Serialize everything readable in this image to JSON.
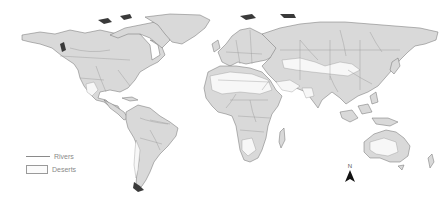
{
  "map": {
    "type": "world-map",
    "projection": "equirectangular",
    "colors": {
      "land": "#d9d9d9",
      "desert": "#f7f7f7",
      "rivers": "#9a9a9a",
      "borders": "#8c8c8c",
      "ocean": "#ffffff"
    }
  },
  "legend": {
    "items": [
      {
        "symbol": "line",
        "label": "Rivers"
      },
      {
        "symbol": "box",
        "label": "Deserts"
      }
    ]
  },
  "north_arrow": {
    "label": "N",
    "icon": "north-arrow-icon"
  }
}
